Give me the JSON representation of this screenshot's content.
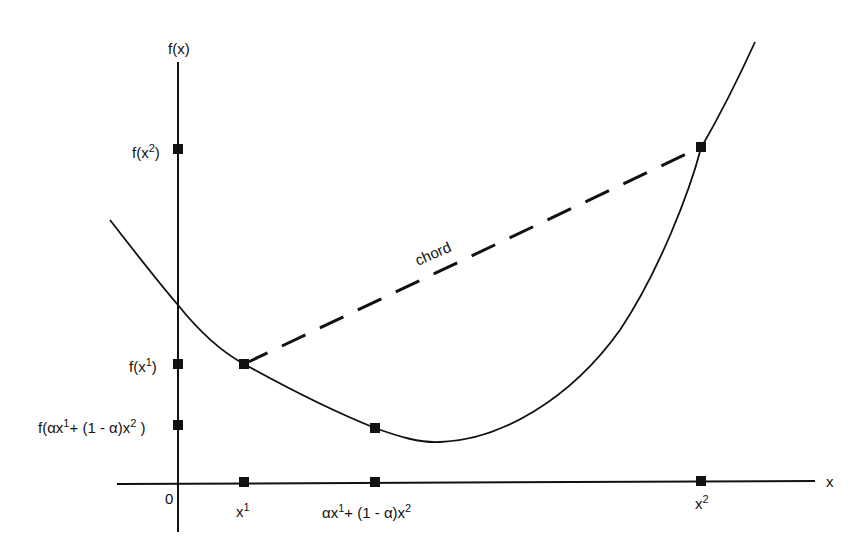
{
  "diagram": {
    "type": "convex-function-chord",
    "axes": {
      "y_label": "f(x)",
      "x_label": "x",
      "origin_label": "0"
    },
    "y_ticks": [
      {
        "base": "f(x",
        "sup": "2",
        "tail": ")"
      },
      {
        "base": "f(x",
        "sup": "1",
        "tail": ")"
      },
      {
        "base": "f(αx",
        "sup": "1",
        "mid": "+ (1 - α)x",
        "sup2": "2",
        "tail": " )"
      }
    ],
    "x_ticks": [
      {
        "base": "x",
        "sup": "1"
      },
      {
        "base": "αx",
        "sup": "1",
        "mid": "+ (1 - α)x",
        "sup2": "2"
      },
      {
        "base": "x",
        "sup": "2"
      }
    ],
    "chord_label": "chord",
    "colors": {
      "ink": "#111111",
      "background": "#ffffff"
    }
  }
}
